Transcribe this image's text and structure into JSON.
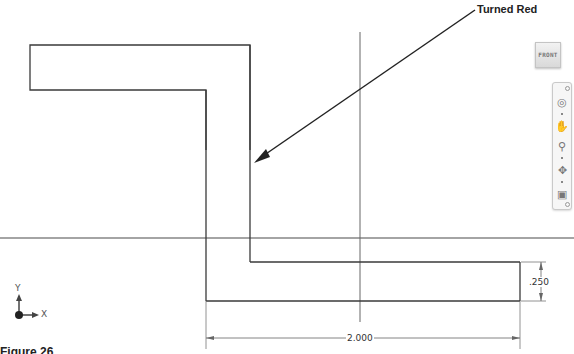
{
  "callout": {
    "label": "Turned Red"
  },
  "viewcube": {
    "face_label": "FRONT"
  },
  "navigation_bar": {
    "tools": [
      {
        "name": "full-navigation-wheel",
        "icon": "steering-wheel-icon"
      },
      {
        "name": "pan",
        "icon": "hand-icon"
      },
      {
        "name": "zoom",
        "icon": "zoom-icon"
      },
      {
        "name": "orbit",
        "icon": "orbit-icon"
      },
      {
        "name": "look-at",
        "icon": "look-at-icon"
      }
    ]
  },
  "dimensions": {
    "height_value": ".250",
    "width_value": "2.000"
  },
  "triad": {
    "y_label": "Y",
    "x_label": "X"
  },
  "caption": {
    "text": "Figure 26"
  },
  "colors": {
    "geometry": "#3a3a3a",
    "centerline": "#555555",
    "dimension": "#666666",
    "background": "#ffffff"
  }
}
